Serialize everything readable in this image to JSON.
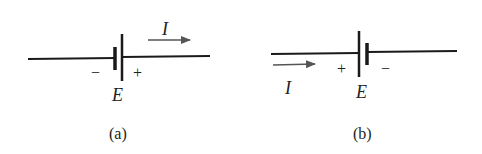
{
  "figure": {
    "panels": [
      {
        "id": "a",
        "caption": "(a)",
        "emf_label": "E",
        "current_label": "I",
        "plus_sign": "+",
        "minus_sign": "−",
        "current_direction": "right",
        "polarity": "negative-left, positive-right"
      },
      {
        "id": "b",
        "caption": "(b)",
        "emf_label": "E",
        "current_label": "I",
        "plus_sign": "+",
        "minus_sign": "−",
        "current_direction": "right",
        "polarity": "positive-left, negative-right"
      }
    ],
    "colors": {
      "wire": "#1a1a1a",
      "arrow": "#555555",
      "text": "#222222"
    }
  }
}
